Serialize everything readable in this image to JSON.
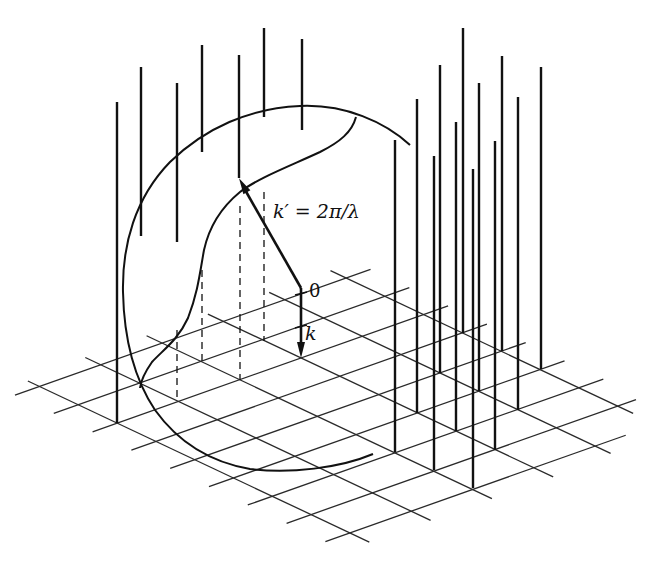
{
  "figure": {
    "labels": {
      "k_prime": "k′ = 2π/λ",
      "origin": "0",
      "k": "k"
    },
    "colors": {
      "ink": "#111111",
      "grid": "#2a2a2a",
      "background": "#ffffff"
    },
    "lattice": {
      "origin": [
        301,
        358
      ],
      "u": [
        38.8,
        18.3
      ],
      "v": [
        61.3,
        -21.7
      ],
      "u_lines": [
        {
          "j": 2,
          "i_from": -2.4,
          "i_to": 5.4
        },
        {
          "j": 1,
          "i_from": -2.4,
          "i_to": 6.4
        },
        {
          "j": 0,
          "i_from": -2.4,
          "i_to": 6.5
        },
        {
          "j": -1,
          "i_from": -2.4,
          "i_to": 6.5
        },
        {
          "j": -2,
          "i_from": -2.4,
          "i_to": 6.5
        },
        {
          "j": -3,
          "i_from": -2.3,
          "i_to": 6.5
        }
      ],
      "v_lines": [
        {
          "i": -2,
          "j_from": -3.4,
          "j_to": 2.4
        },
        {
          "i": -1,
          "j_from": -3.4,
          "j_to": 2.4
        },
        {
          "i": 0,
          "j_from": -3.4,
          "j_to": 2.4
        },
        {
          "i": 1,
          "j_from": -3.4,
          "j_to": 2.4
        },
        {
          "i": 2,
          "j_from": -3.4,
          "j_to": 2.4
        },
        {
          "i": 3,
          "j_from": -3.4,
          "j_to": 2.4
        },
        {
          "i": 4,
          "j_from": -3.4,
          "j_to": 2.4
        },
        {
          "i": 5,
          "j_from": -3.4,
          "j_to": 2.3
        },
        {
          "i": 6,
          "j_from": -3.4,
          "j_to": 1.5
        }
      ]
    },
    "rods_grounded": [
      {
        "x": 117,
        "top": 102,
        "bottom": 423
      },
      {
        "x": 395,
        "top": 140,
        "bottom": 452
      },
      {
        "x": 417,
        "top": 99,
        "bottom": 413
      },
      {
        "x": 434,
        "top": 156,
        "bottom": 470
      },
      {
        "x": 440,
        "top": 65,
        "bottom": 373
      },
      {
        "x": 456,
        "top": 122,
        "bottom": 431
      },
      {
        "x": 463,
        "top": 28,
        "bottom": 333
      },
      {
        "x": 473,
        "top": 169,
        "bottom": 488
      },
      {
        "x": 479,
        "top": 83,
        "bottom": 391
      },
      {
        "x": 495,
        "top": 141,
        "bottom": 450
      },
      {
        "x": 502,
        "top": 56,
        "bottom": 351
      },
      {
        "x": 518,
        "top": 97,
        "bottom": 410
      },
      {
        "x": 541,
        "top": 67,
        "bottom": 369
      }
    ],
    "rods_floating": [
      {
        "x": 141,
        "top": 67,
        "bottom": 236
      },
      {
        "x": 177,
        "top": 83,
        "bottom": 242
      },
      {
        "x": 202,
        "top": 45,
        "bottom": 152
      },
      {
        "x": 239,
        "top": 55,
        "bottom": 178
      },
      {
        "x": 264,
        "top": 28,
        "bottom": 117
      },
      {
        "x": 302,
        "top": 39,
        "bottom": 130
      }
    ],
    "projections_dashed": [
      {
        "x": 177,
        "top": 330,
        "bottom": 402
      },
      {
        "x": 202,
        "top": 270,
        "bottom": 362
      },
      {
        "x": 240,
        "top": 206,
        "bottom": 380
      },
      {
        "x": 264,
        "top": 192,
        "bottom": 341
      }
    ],
    "sphere_outer_path": "M 410 145 C 385 122 345 104 300 106 C 250 108 205 128 170 162 C 135 198 122 245 123 292 C 124 340 135 380 155 410 C 178 442 210 462 250 469 C 290 474 340 468 373 454",
    "sphere_inner_path": "M 356 117 C 352 132 340 142 320 152 C 290 166 258 178 240 192 C 218 210 208 232 204 250 C 200 272 198 292 188 318 C 178 340 163 350 152 362 C 145 372 141 380 140 388",
    "k_prime_vector": {
      "from": [
        301,
        288
      ],
      "to": [
        240,
        180
      ]
    },
    "k_vector": {
      "from": [
        301,
        288
      ],
      "to": [
        301,
        358
      ]
    },
    "k_ticks_y": [
      295,
      328
    ]
  }
}
